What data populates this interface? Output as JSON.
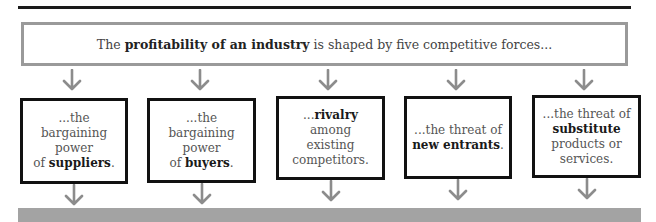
{
  "header": {
    "prefix": "The ",
    "bold": "profitability of an industry",
    "suffix": " is shaped by five competitive forces..."
  },
  "forces": [
    {
      "pre": "...the bargaining power of ",
      "bold": "suppliers",
      "post": ".",
      "lines": [
        "...the bargaining",
        "power",
        "of |suppliers|."
      ]
    },
    {
      "pre": "...the bargaining power of ",
      "bold": "buyers",
      "post": ".",
      "lines": [
        "...the bargaining",
        "power",
        "of |buyers|."
      ]
    },
    {
      "pre": "...",
      "bold": "rivalry",
      "post": " among existing competitors.",
      "lines": [
        "...|rivalry| among",
        "existing",
        "competitors."
      ]
    },
    {
      "pre": "...the threat of ",
      "bold": "new entrants",
      "post": ".",
      "lines": [
        "...the threat of",
        "|new entrants|."
      ]
    },
    {
      "pre": "...the threat of ",
      "bold": "substitute",
      "post": " products or services.",
      "lines": [
        "...the threat of",
        "|substitute|",
        "products or",
        "services."
      ]
    }
  ],
  "colors": {
    "arrow": "#8c8c8c",
    "box_border": "#111111",
    "top_border": "#9a9a9a",
    "band": "#a3a3a3"
  }
}
